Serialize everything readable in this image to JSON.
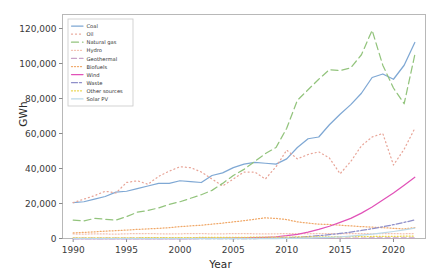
{
  "chart_data": {
    "type": "line",
    "title": "",
    "xlabel": "Year",
    "ylabel": "GWh",
    "xlim": [
      1989,
      2023
    ],
    "ylim": [
      0,
      128000
    ],
    "xticks": [
      1990,
      1995,
      2000,
      2005,
      2010,
      2015,
      2020
    ],
    "yticks": [
      0,
      20000,
      40000,
      60000,
      80000,
      100000,
      120000
    ],
    "ytick_labels": [
      "0",
      "20,000",
      "40,000",
      "60,000",
      "80,000",
      "100,000",
      "120,000"
    ],
    "grid": false,
    "legend_position": "upper left",
    "x": [
      1990,
      1991,
      1992,
      1993,
      1994,
      1995,
      1996,
      1997,
      1998,
      1999,
      2000,
      2001,
      2002,
      2003,
      2004,
      2005,
      2006,
      2007,
      2008,
      2009,
      2010,
      2011,
      2012,
      2013,
      2014,
      2015,
      2016,
      2017,
      2018,
      2019,
      2020,
      2021,
      2022
    ],
    "series": [
      {
        "name": "Coal",
        "color": "#7fa8d4",
        "dash": "none",
        "values": [
          20500,
          21000,
          22500,
          24000,
          26500,
          27000,
          28500,
          30000,
          31500,
          31500,
          33000,
          32500,
          32000,
          36000,
          37500,
          40500,
          42500,
          43500,
          43000,
          42500,
          45500,
          52000,
          57000,
          58000,
          65000,
          71000,
          76500,
          83000,
          92000,
          94000,
          91000,
          99000,
          112000
        ]
      },
      {
        "name": "Oil",
        "color": "#e8a598",
        "dash": "1,3",
        "values": [
          20500,
          22500,
          24500,
          27000,
          26000,
          32000,
          33000,
          31000,
          35500,
          38500,
          41000,
          40500,
          38000,
          34000,
          30000,
          34000,
          38000,
          38000,
          34000,
          41000,
          50500,
          45500,
          48000,
          49500,
          46000,
          37000,
          44000,
          53000,
          58000,
          60000,
          42000,
          51000,
          63000
        ]
      },
      {
        "name": "Natural gas",
        "color": "#93c47d",
        "dash": "7,4"
      },
      {
        "name": "Hydro",
        "color": "#f3c1b0",
        "dash": "1,2"
      },
      {
        "name": "Geothermal",
        "color": "#c8a2c8",
        "dash": "5,3"
      },
      {
        "name": "Biofuels",
        "color": "#f0a868",
        "dash": "1,2"
      },
      {
        "name": "Wind",
        "color": "#e152b8",
        "dash": "none"
      },
      {
        "name": "Waste",
        "color": "#8f8fc9",
        "dash": "6,2,2,2"
      },
      {
        "name": "Other sources",
        "color": "#e8d44a",
        "dash": "1,2"
      },
      {
        "name": "Solar PV",
        "color": "#bcd9e8",
        "dash": "none"
      }
    ],
    "series_values": {
      "Natural gas": [
        10500,
        10000,
        11500,
        11000,
        10500,
        12500,
        15000,
        16000,
        17500,
        19500,
        21000,
        23000,
        25000,
        27500,
        31500,
        36000,
        39500,
        44000,
        48500,
        52000,
        63000,
        79000,
        85000,
        91000,
        96500,
        96000,
        97500,
        105000,
        119000,
        99000,
        86000,
        77000,
        105000
      ],
      "Hydro": [
        2600,
        2500,
        2650,
        2600,
        2500,
        2700,
        2750,
        2800,
        2700,
        2600,
        2700,
        2750,
        2800,
        2650,
        2700,
        2750,
        2800,
        2700,
        2600,
        2700,
        2750,
        2800,
        2700,
        2800,
        2750,
        2700,
        2800,
        2750,
        2700,
        2800,
        2750,
        2700,
        2800
      ],
      "Geothermal": [
        150,
        150,
        160,
        160,
        170,
        170,
        180,
        180,
        190,
        190,
        200,
        200,
        210,
        210,
        220,
        220,
        230,
        230,
        240,
        240,
        250,
        250,
        260,
        260,
        270,
        270,
        280,
        280,
        290,
        290,
        300,
        300,
        310
      ],
      "Biofuels": [
        3200,
        3500,
        3800,
        4200,
        4500,
        4800,
        5200,
        5500,
        5800,
        6200,
        6800,
        7200,
        7600,
        8200,
        8800,
        9500,
        10200,
        11000,
        11800,
        11500,
        10800,
        9500,
        8800,
        8200,
        8000,
        7600,
        7200,
        6800,
        6500,
        6200,
        5800,
        5500,
        6200
      ],
      "Wind": [
        0,
        0,
        0,
        0,
        0,
        0,
        0,
        0,
        0,
        0,
        0,
        0,
        50,
        80,
        120,
        200,
        300,
        450,
        700,
        1000,
        1600,
        2400,
        3600,
        5200,
        7000,
        9200,
        11500,
        14500,
        18000,
        22000,
        26000,
        30500,
        35000
      ],
      "Waste": [
        0,
        0,
        0,
        0,
        0,
        0,
        0,
        0,
        0,
        0,
        0,
        0,
        0,
        0,
        0,
        0,
        0,
        0,
        100,
        200,
        400,
        700,
        1100,
        1600,
        2200,
        2900,
        3700,
        4600,
        5600,
        6700,
        7900,
        9200,
        10600
      ],
      "Other sources": [
        300,
        320,
        340,
        360,
        380,
        400,
        420,
        450,
        470,
        500,
        520,
        550,
        580,
        600,
        630,
        660,
        700,
        730,
        760,
        800,
        830,
        870,
        900,
        940,
        980,
        1020,
        1060,
        1100,
        1150,
        1200,
        1250,
        1300,
        1350
      ],
      "Solar PV": [
        0,
        0,
        0,
        0,
        0,
        0,
        0,
        0,
        0,
        0,
        0,
        0,
        0,
        0,
        0,
        0,
        0,
        0,
        0,
        0,
        50,
        120,
        250,
        450,
        700,
        1000,
        1400,
        1900,
        2500,
        3200,
        4000,
        4900,
        5900
      ]
    }
  },
  "legend": {
    "items": [
      {
        "label": "Coal"
      },
      {
        "label": "Oil"
      },
      {
        "label": "Natural gas"
      },
      {
        "label": "Hydro"
      },
      {
        "label": "Geothermal"
      },
      {
        "label": "Biofuels"
      },
      {
        "label": "Wind"
      },
      {
        "label": "Waste"
      },
      {
        "label": "Other sources"
      },
      {
        "label": "Solar PV"
      }
    ]
  },
  "axes": {
    "ylabel": "GWh",
    "xlabel": "Year"
  }
}
